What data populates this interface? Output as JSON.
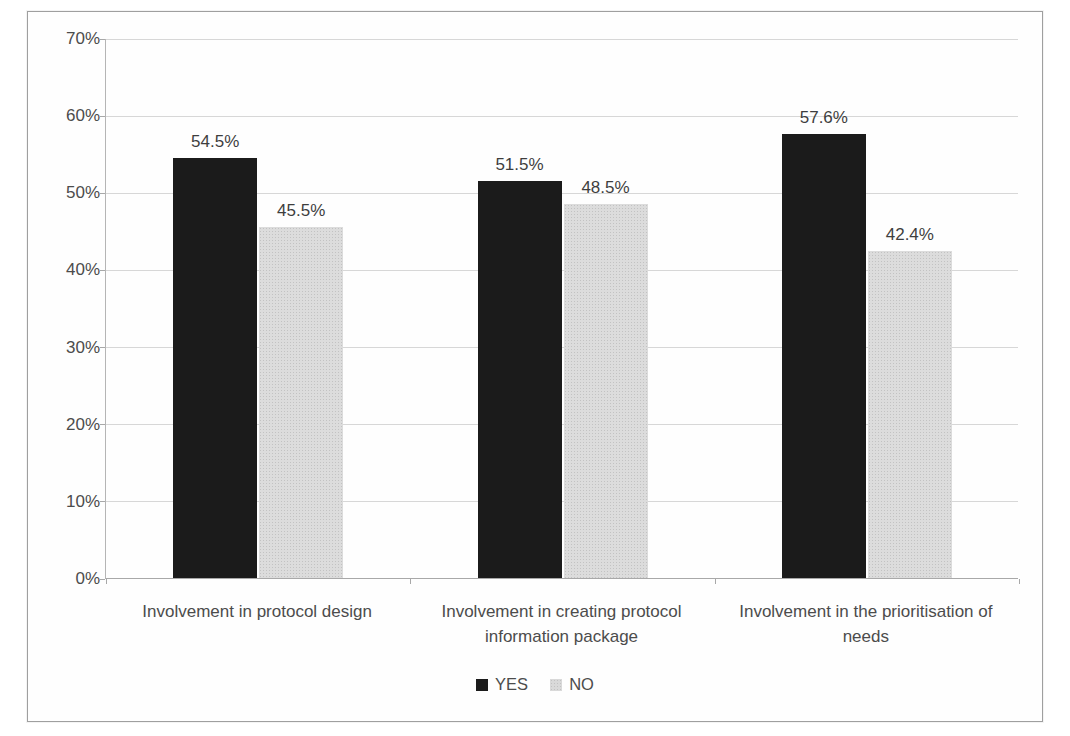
{
  "chart_data": {
    "type": "bar",
    "title": "",
    "categories": [
      "Involvement in protocol design",
      "Involvement in creating protocol information package",
      "Involvement in the prioritisation of needs"
    ],
    "series": [
      {
        "name": "YES",
        "color": "#1b1b1b",
        "values": [
          54.5,
          51.5,
          57.6
        ],
        "data_labels": [
          "54.5%",
          "51.5%",
          "57.6%"
        ]
      },
      {
        "name": "NO",
        "color": "#d9d9d9",
        "values": [
          45.5,
          48.5,
          42.4
        ],
        "data_labels": [
          "45.5%",
          "48.5%",
          "42.4%"
        ]
      }
    ],
    "xlabel": "",
    "ylabel": "",
    "ylim": [
      0,
      70
    ],
    "ytick_step": 10,
    "ytick_labels": [
      "0%",
      "10%",
      "20%",
      "30%",
      "40%",
      "50%",
      "60%",
      "70%"
    ],
    "grid": true,
    "legend_position": "bottom",
    "colors": {
      "yes_bar": "#1b1b1b",
      "no_bar": "#d9d9d9",
      "gridline": "#d7d7d7",
      "axis": "#a8a8a8",
      "text": "#4c4c4c",
      "frame_border": "#9f9f9f",
      "background": "#ffffff"
    }
  }
}
